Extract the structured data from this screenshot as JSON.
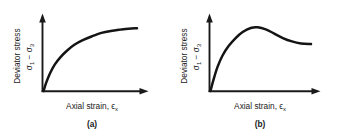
{
  "figure": {
    "background_color": "#ffffff",
    "ink_color": "#141414",
    "panels": [
      {
        "id": "a",
        "caption": "(a)",
        "curve_type": "strain-hardening",
        "xaxis": {
          "label_main": "Axial strain,",
          "label_symbol": "ϵ",
          "label_subscript": "x",
          "arrow": true,
          "ticks": []
        },
        "yaxis": {
          "label_line1": "Deviator stress",
          "label_line2_a": "σ",
          "label_line2_a_sub": "1",
          "label_line2_op": "−",
          "label_line2_b": "σ",
          "label_line2_b_sub": "3",
          "arrow": true,
          "ticks": []
        }
      },
      {
        "id": "b",
        "caption": "(b)",
        "curve_type": "strain-softening",
        "xaxis": {
          "label_main": "Axial strain,",
          "label_symbol": "ϵ",
          "label_subscript": "x",
          "arrow": true,
          "ticks": []
        },
        "yaxis": {
          "label_line1": "Deviator stress",
          "label_line2_a": "σ",
          "label_line2_a_sub": "1",
          "label_line2_op": "−",
          "label_line2_b": "σ",
          "label_line2_b_sub": "3",
          "arrow": true,
          "ticks": []
        }
      }
    ]
  },
  "chart_data": [
    {
      "type": "line",
      "panel": "a",
      "title": "(a)",
      "xlabel": "Axial strain, ϵx",
      "ylabel": "Deviator stress σ1 − σ3",
      "xlim": [
        0,
        1
      ],
      "ylim": [
        0,
        1
      ],
      "grid": false,
      "legend": null,
      "description": "Strain-hardening: deviator stress rises steeply from the origin and asymptotically approaches a plateau (ultimate strength).",
      "series": [
        {
          "name": "strain-hardening curve",
          "x": [
            0.0,
            0.03,
            0.07,
            0.12,
            0.18,
            0.25,
            0.33,
            0.42,
            0.52,
            0.62,
            0.72,
            0.82,
            0.91,
            1.0
          ],
          "y": [
            0.0,
            0.13,
            0.27,
            0.4,
            0.51,
            0.61,
            0.7,
            0.77,
            0.83,
            0.88,
            0.91,
            0.93,
            0.945,
            0.95
          ]
        }
      ]
    },
    {
      "type": "line",
      "panel": "b",
      "title": "(b)",
      "xlabel": "Axial strain, ϵx",
      "ylabel": "Deviator stress σ1 − σ3",
      "xlim": [
        0,
        1
      ],
      "ylim": [
        0,
        1
      ],
      "grid": false,
      "legend": null,
      "description": "Strain-softening: deviator stress rises to a distinct peak, then decreases toward a lower residual plateau.",
      "series": [
        {
          "name": "strain-softening curve",
          "x": [
            0.0,
            0.03,
            0.07,
            0.12,
            0.18,
            0.25,
            0.32,
            0.4,
            0.47,
            0.55,
            0.63,
            0.72,
            0.81,
            0.9,
            1.0
          ],
          "y": [
            0.0,
            0.17,
            0.36,
            0.53,
            0.67,
            0.79,
            0.88,
            0.94,
            0.95,
            0.92,
            0.86,
            0.79,
            0.74,
            0.71,
            0.7
          ]
        }
      ]
    }
  ]
}
